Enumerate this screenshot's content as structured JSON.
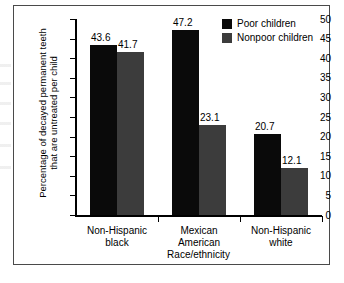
{
  "chart_data": {
    "type": "bar",
    "title": "",
    "subtitle": "",
    "xlabel": "Race/ethnicity",
    "ylabel": "Percentage of decayed permanent teeth\nthat are untreated per child",
    "categories": [
      "Non-Hispanic\nblack",
      "Mexican\nAmerican",
      "Non-Hispanic\nwhite"
    ],
    "series": [
      {
        "name": "Poor children",
        "color": "#0a0a0a",
        "values": [
          43.6,
          47.2,
          20.7
        ],
        "value_labels": [
          "43.6",
          "47.2",
          "20.7"
        ]
      },
      {
        "name": "Nonpoor children",
        "color": "#3c3c3c",
        "values": [
          41.7,
          23.1,
          12.1
        ],
        "value_labels": [
          "41.7",
          "23.1",
          "12.1"
        ]
      }
    ],
    "ylim": [
      0,
      50
    ],
    "yticks": [
      0,
      5,
      10,
      15,
      20,
      25,
      30,
      35,
      40,
      45,
      50
    ],
    "ytick_labels": [
      "0",
      "5",
      "10",
      "15",
      "20",
      "25",
      "30",
      "35",
      "40",
      "45",
      "50"
    ],
    "grid": false,
    "legend_position": "top-right"
  },
  "legend": {
    "items": [
      {
        "label": "Poor children",
        "color": "#0a0a0a"
      },
      {
        "label": "Nonpoor children",
        "color": "#3c3c3c"
      }
    ]
  },
  "axes": {
    "x_title": "Race/ethnicity",
    "y_title": "Percentage of decayed permanent teeth\nthat are untreated per child"
  }
}
